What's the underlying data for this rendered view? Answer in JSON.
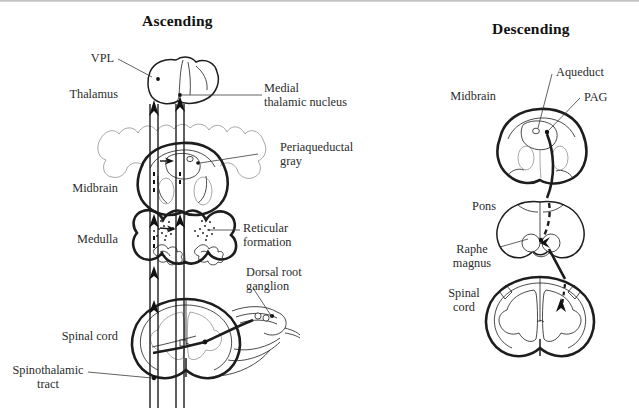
{
  "figure": {
    "type": "anatomical-line-diagram",
    "background_color": "#ffffff",
    "ink_color": "#1d1d1d"
  },
  "panels": [
    {
      "id": "ascending",
      "title": "Ascending",
      "level_labels": [
        {
          "name": "thalamus",
          "text": "Thalamus"
        },
        {
          "name": "midbrain",
          "text": "Midbrain"
        },
        {
          "name": "medulla",
          "text": "Medulla"
        },
        {
          "name": "spinal-cord",
          "text": "Spinal cord"
        }
      ],
      "callouts": [
        {
          "name": "vpl",
          "text": "VPL"
        },
        {
          "name": "medial-thalamic-nucleus",
          "line1": "Medial",
          "line2": "thalamic nucleus"
        },
        {
          "name": "periaqueductal-gray",
          "line1": "Periaqueductal",
          "line2": "gray"
        },
        {
          "name": "reticular-formation",
          "line1": "Reticular",
          "line2": "formation"
        },
        {
          "name": "dorsal-root-ganglion",
          "line1": "Dorsal root",
          "line2": "ganglion"
        },
        {
          "name": "spinothalamic-tract",
          "line1": "Spinothalamic",
          "line2": "tract"
        }
      ]
    },
    {
      "id": "descending",
      "title": "Descending",
      "level_labels": [
        {
          "name": "midbrain",
          "text": "Midbrain"
        },
        {
          "name": "pons",
          "text": "Pons"
        },
        {
          "name": "spinal-cord",
          "line1": "Spinal",
          "line2": "cord"
        }
      ],
      "callouts": [
        {
          "name": "aqueduct",
          "text": "Aqueduct"
        },
        {
          "name": "pag",
          "text": "PAG"
        },
        {
          "name": "raphe-magnus",
          "line1": "Raphe",
          "line2": "magnus"
        }
      ]
    }
  ]
}
